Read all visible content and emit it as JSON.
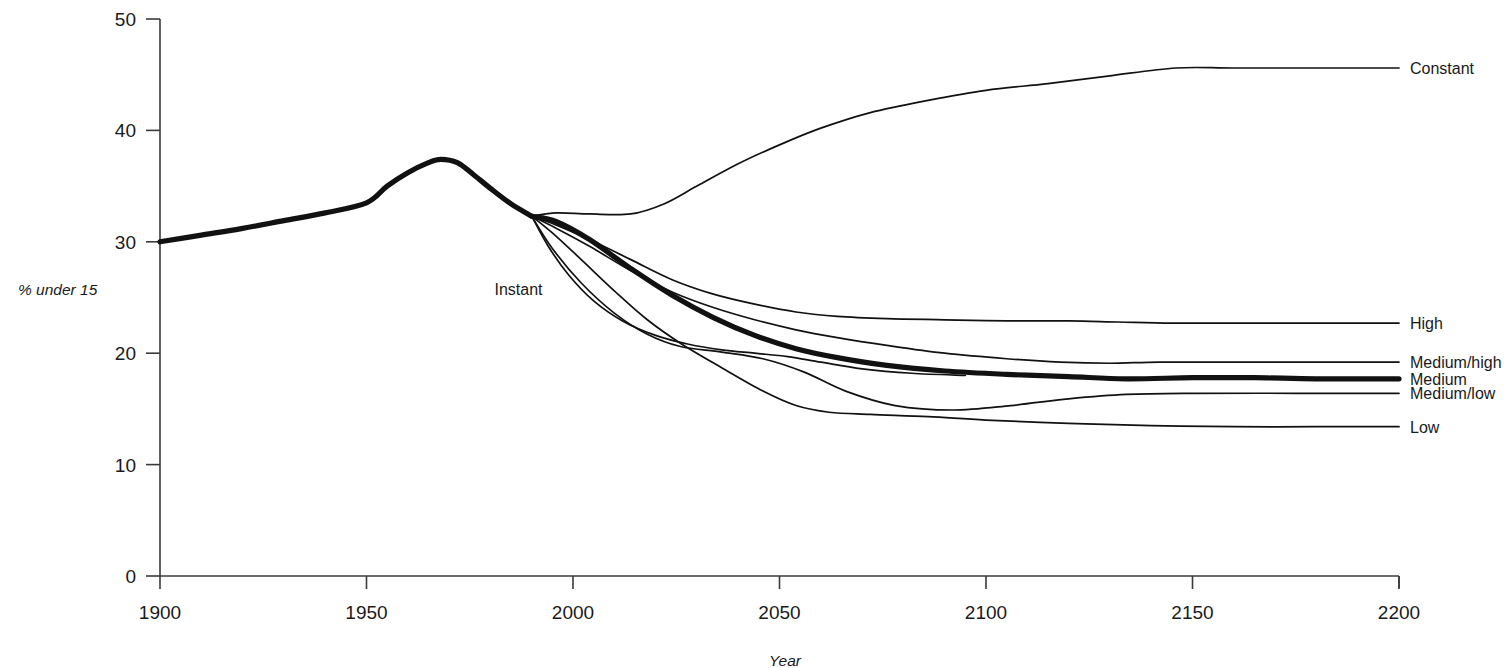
{
  "chart_data": {
    "type": "line",
    "title": "",
    "xlabel": "Year",
    "ylabel": "% under 15",
    "xlim": [
      1900,
      2200
    ],
    "ylim": [
      0,
      50
    ],
    "xticks": [
      1900,
      1950,
      2000,
      2050,
      2100,
      2150,
      2200
    ],
    "xticklabels": [
      "1900",
      "1950",
      "2000",
      "2050",
      "2100",
      "2150",
      "2200"
    ],
    "yticks": [
      0,
      10,
      20,
      30,
      40,
      50
    ],
    "yticklabels": [
      "0",
      "10",
      "20",
      "30",
      "40",
      "50"
    ],
    "grid": false,
    "legend_position": "right-inline-labels",
    "annotations": [
      {
        "text": "Instant",
        "x": 1981,
        "y": 25.2
      }
    ],
    "series": [
      {
        "name": "Historical",
        "label": "",
        "style": "thick",
        "x": [
          1900,
          1910,
          1920,
          1930,
          1940,
          1950,
          1955,
          1960,
          1965,
          1968,
          1972,
          1976,
          1980,
          1985,
          1990
        ],
        "values": [
          30.0,
          30.6,
          31.2,
          31.9,
          32.6,
          33.5,
          35.0,
          36.2,
          37.1,
          37.4,
          37.1,
          36.0,
          34.8,
          33.4,
          32.3
        ]
      },
      {
        "name": "Constant",
        "label": "Constant",
        "style": "thin",
        "x": [
          1990,
          1996,
          2004,
          2014,
          2022,
          2030,
          2040,
          2050,
          2060,
          2072,
          2086,
          2100,
          2115,
          2130,
          2146,
          2160,
          2180,
          2200
        ],
        "values": [
          32.3,
          32.6,
          32.5,
          32.5,
          33.4,
          35.0,
          37.0,
          38.7,
          40.2,
          41.6,
          42.7,
          43.6,
          44.2,
          44.9,
          45.6,
          45.6,
          45.6,
          45.6
        ]
      },
      {
        "name": "High",
        "label": "High",
        "style": "thin",
        "x": [
          1990,
          1996,
          2004,
          2014,
          2024,
          2034,
          2044,
          2054,
          2064,
          2076,
          2090,
          2105,
          2120,
          2132,
          2145,
          2160,
          2180,
          2200
        ],
        "values": [
          32.3,
          31.5,
          30.2,
          28.4,
          26.6,
          25.3,
          24.4,
          23.7,
          23.3,
          23.1,
          23.0,
          22.9,
          22.9,
          22.8,
          22.7,
          22.7,
          22.7,
          22.7
        ]
      },
      {
        "name": "Medium/high",
        "label": "Medium/high",
        "style": "thin",
        "x": [
          1990,
          1996,
          2004,
          2014,
          2024,
          2034,
          2044,
          2054,
          2064,
          2076,
          2090,
          2105,
          2118,
          2130,
          2142,
          2160,
          2180,
          2200
        ],
        "values": [
          32.3,
          31.2,
          29.6,
          27.4,
          25.5,
          24.1,
          23.0,
          22.1,
          21.4,
          20.7,
          20.0,
          19.5,
          19.2,
          19.1,
          19.2,
          19.2,
          19.2,
          19.2
        ]
      },
      {
        "name": "Medium",
        "label": "Medium",
        "style": "thick",
        "x": [
          1990,
          1996,
          2004,
          2014,
          2024,
          2034,
          2044,
          2054,
          2064,
          2076,
          2090,
          2105,
          2120,
          2134,
          2150,
          2165,
          2180,
          2200
        ],
        "values": [
          32.3,
          31.8,
          30.2,
          27.6,
          25.2,
          23.2,
          21.6,
          20.4,
          19.6,
          18.9,
          18.4,
          18.1,
          17.9,
          17.7,
          17.8,
          17.8,
          17.7,
          17.7
        ]
      },
      {
        "name": "Medium/low",
        "label": "Medium/low",
        "style": "thin",
        "x": [
          1990,
          1995,
          2002,
          2010,
          2018,
          2026,
          2036,
          2046,
          2056,
          2066,
          2078,
          2092,
          2106,
          2120,
          2134,
          2150,
          2175,
          2200
        ],
        "values": [
          32.3,
          29.4,
          26.3,
          23.6,
          21.7,
          20.6,
          20.1,
          19.5,
          18.3,
          16.6,
          15.3,
          14.9,
          15.3,
          15.9,
          16.3,
          16.4,
          16.4,
          16.4
        ]
      },
      {
        "name": "Low",
        "label": "Low",
        "style": "thin",
        "x": [
          1990,
          1995,
          2002,
          2010,
          2018,
          2026,
          2036,
          2046,
          2054,
          2062,
          2072,
          2086,
          2100,
          2120,
          2140,
          2160,
          2180,
          2200
        ],
        "values": [
          32.3,
          30.8,
          28.4,
          25.6,
          23.0,
          20.9,
          18.7,
          16.6,
          15.3,
          14.7,
          14.5,
          14.3,
          14.0,
          13.7,
          13.5,
          13.4,
          13.4,
          13.4
        ]
      },
      {
        "name": "Instant",
        "label": "",
        "style": "thin",
        "x": [
          1990,
          1994,
          1999,
          2005,
          2012,
          2020,
          2028,
          2036,
          2044,
          2052,
          2060,
          2070,
          2082,
          2095
        ],
        "values": [
          32.3,
          29.6,
          27.0,
          24.7,
          22.9,
          21.6,
          20.8,
          20.3,
          20.0,
          19.7,
          19.2,
          18.6,
          18.2,
          18.0
        ]
      }
    ]
  },
  "axis": {
    "y_title": "% under 15",
    "x_title": "Year"
  }
}
